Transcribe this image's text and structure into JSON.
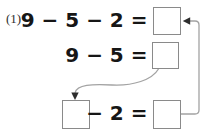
{
  "problem": {
    "number_label": "(1)",
    "line1": {
      "expression": "9 − 5 − 2 =",
      "answer_value": ""
    },
    "line2": {
      "expression": "9 − 5 =",
      "answer_value": ""
    },
    "line3": {
      "expression": "− 2 =",
      "operand_value": "",
      "answer_value": ""
    }
  },
  "connectors": [
    {
      "name": "carry-down-arrow",
      "from": "line2-answer-box",
      "to": "line3-operand-box",
      "shape": "s-curve",
      "arrowhead": "down"
    },
    {
      "name": "feedback-arrow",
      "from": "line3-answer-box",
      "to": "line1-answer-box",
      "shape": "right-angle",
      "arrowhead": "left"
    }
  ],
  "colors": {
    "text": "#161616",
    "label": "#2e2e2e",
    "box_border": "#8a8a8a",
    "connector": "#a3a3a3",
    "arrowhead": "#2d2d2d",
    "background": "#ffffff"
  }
}
